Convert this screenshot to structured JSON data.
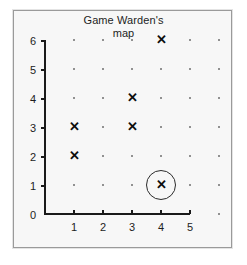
{
  "figure": {
    "title_lines": [
      "Game Warden's",
      "map"
    ],
    "background_color": "#f7f7f7",
    "frame_color": "#9a9a9a",
    "axis_color": "#1a1a1a",
    "grid_dot_color": "#6f6f6f",
    "marker_color": "#0d0d0d",
    "highlight_circle_color": "#2b2b2b",
    "marker_glyph": "✕"
  },
  "chart_data": {
    "type": "scatter",
    "title": "Game Warden's map",
    "xlabel": "",
    "ylabel": "",
    "xlim": [
      0,
      6
    ],
    "ylim": [
      0,
      6
    ],
    "grid": true,
    "grid_style": "dots at every integer lattice point",
    "legend": "none",
    "x_tick_labels": [
      "1",
      "2",
      "3",
      "4",
      "5"
    ],
    "x_tick_values": [
      1,
      2,
      3,
      4,
      5
    ],
    "y_tick_labels": [
      "0",
      "1",
      "2",
      "3",
      "4",
      "5",
      "6"
    ],
    "y_tick_values": [
      0,
      1,
      2,
      3,
      4,
      5,
      6
    ],
    "series": [
      {
        "name": "marked locations",
        "marker": "x",
        "points": [
          {
            "x": 1,
            "y": 2
          },
          {
            "x": 1,
            "y": 3
          },
          {
            "x": 3,
            "y": 3
          },
          {
            "x": 3,
            "y": 4
          },
          {
            "x": 4,
            "y": 6
          },
          {
            "x": 4,
            "y": 1
          }
        ]
      },
      {
        "name": "circled location",
        "marker": "circle-highlight",
        "points": [
          {
            "x": 4,
            "y": 1
          }
        ]
      }
    ],
    "annotations": [
      {
        "type": "circle",
        "x": 4,
        "y": 1,
        "note": "circled X marker"
      }
    ]
  },
  "grid_dots": {
    "x_values": [
      0,
      1,
      2,
      3,
      4,
      5,
      6
    ],
    "y_values": [
      0,
      1,
      2,
      3,
      4,
      5,
      6
    ],
    "note": "dots drawn at lattice points not covered by axes or X markers"
  }
}
